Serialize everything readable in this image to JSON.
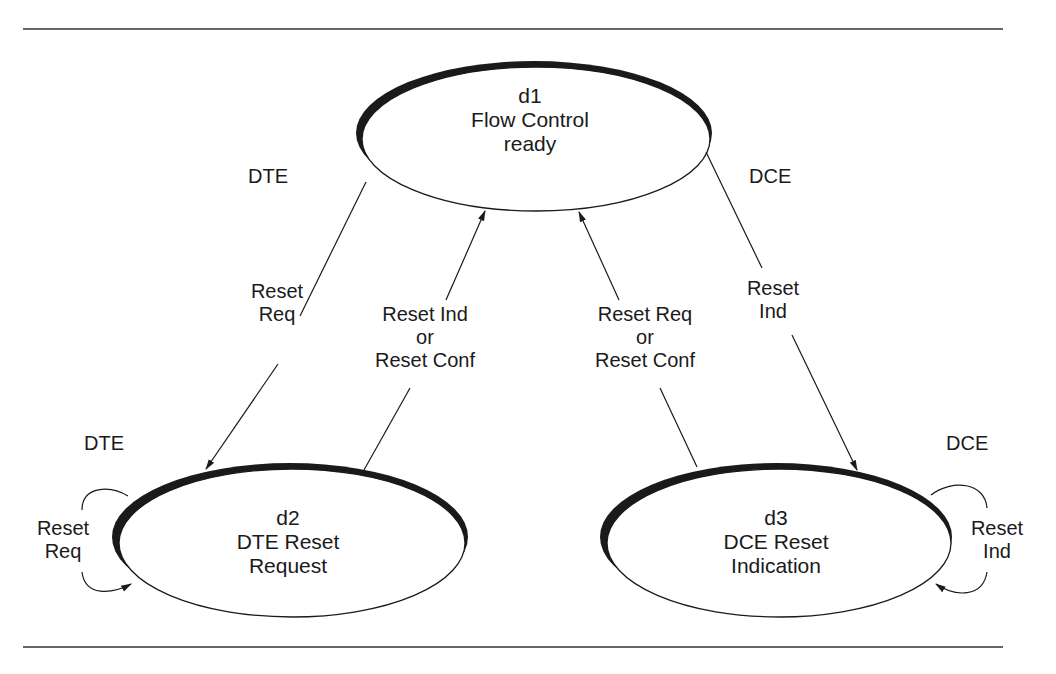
{
  "states": {
    "d1": {
      "id": "d1",
      "line1": "Flow Control",
      "line2": "ready"
    },
    "d2": {
      "id": "d2",
      "line1": "DTE Reset",
      "line2": "Request"
    },
    "d3": {
      "id": "d3",
      "line1": "DCE Reset",
      "line2": "Indication"
    }
  },
  "actors": {
    "dte_top": "DTE",
    "dce_top": "DCE",
    "dte_loop": "DTE",
    "dce_loop": "DCE"
  },
  "transitions": {
    "d1_to_d2": {
      "line1": "Reset",
      "line2": "Req"
    },
    "d2_to_d1": {
      "line1": "Reset Ind",
      "line2": "or",
      "line3": "Reset Conf"
    },
    "d3_to_d1": {
      "line1": "Reset Req",
      "line2": "or",
      "line3": "Reset Conf"
    },
    "d1_to_d3": {
      "line1": "Reset",
      "line2": "Ind"
    },
    "d2_self": {
      "line1": "Reset",
      "line2": "Req"
    },
    "d3_self": {
      "line1": "Reset",
      "line2": "Ind"
    }
  },
  "colors": {
    "stroke": "#1a1a1a",
    "background": "#ffffff"
  }
}
